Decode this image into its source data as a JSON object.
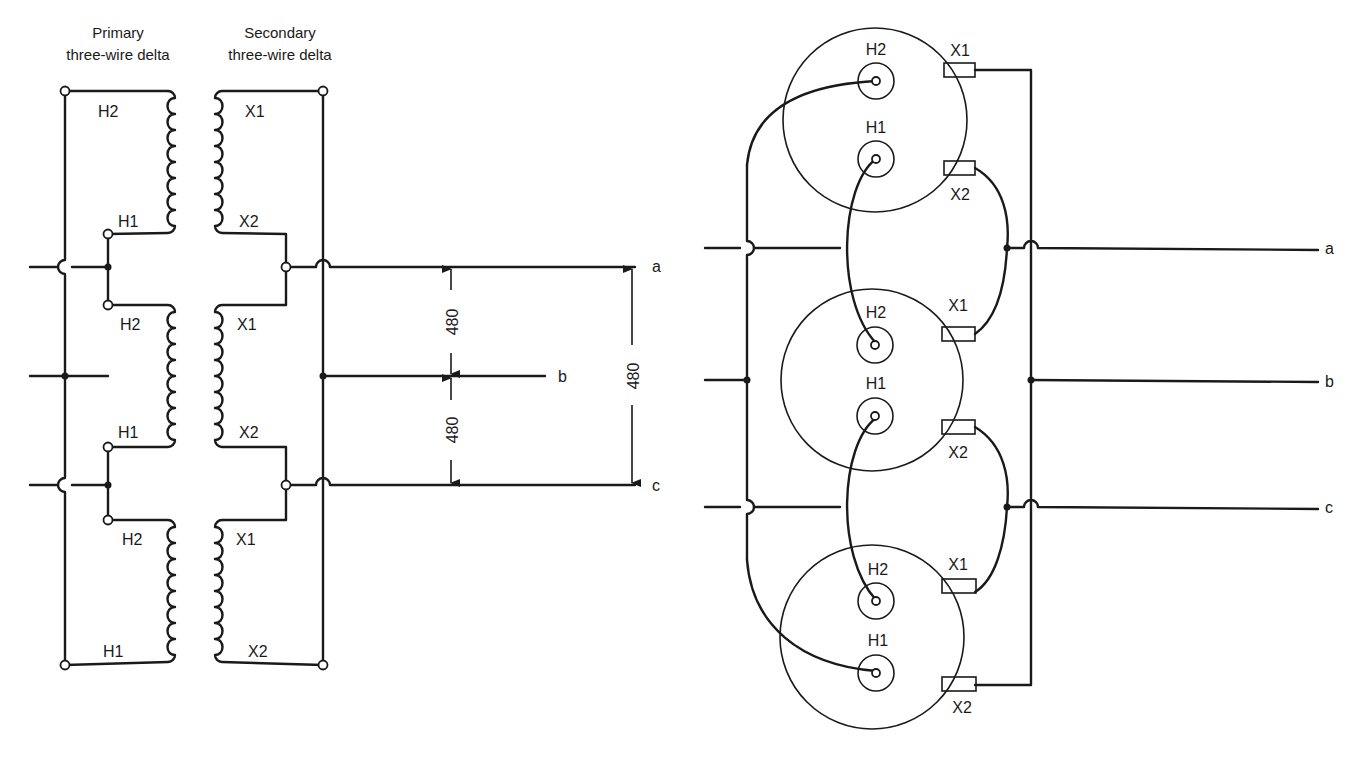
{
  "left_diagram": {
    "primary_title_line1": "Primary",
    "primary_title_line2": "three-wire delta",
    "secondary_title_line1": "Secondary",
    "secondary_title_line2": "three-wire delta",
    "transformers": [
      {
        "primary_top": "H2",
        "primary_bottom": "H1",
        "secondary_top": "X1",
        "secondary_bottom": "X2"
      },
      {
        "primary_top": "H2",
        "primary_bottom": "H1",
        "secondary_top": "X1",
        "secondary_bottom": "X2"
      },
      {
        "primary_top": "H2",
        "primary_bottom": "H1",
        "secondary_top": "X1",
        "secondary_bottom": "X2"
      }
    ],
    "output_lines": [
      "a",
      "b",
      "c"
    ],
    "voltages": {
      "a_b": "480",
      "b_c": "480",
      "a_c": "480"
    }
  },
  "right_diagram": {
    "transformers": [
      {
        "h_top": "H2",
        "h_bottom": "H1",
        "x_top": "X1",
        "x_bottom": "X2"
      },
      {
        "h_top": "H2",
        "h_bottom": "H1",
        "x_top": "X1",
        "x_bottom": "X2"
      },
      {
        "h_top": "H2",
        "h_bottom": "H1",
        "x_top": "X1",
        "x_bottom": "X2"
      }
    ],
    "output_lines": [
      "a",
      "b",
      "c"
    ]
  }
}
